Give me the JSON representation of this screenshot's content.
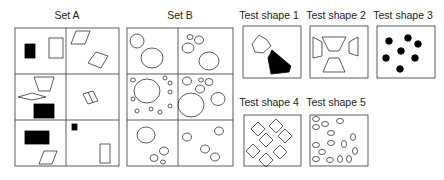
{
  "sets": [
    {
      "label": "Set A"
    },
    {
      "label": "Set B"
    }
  ],
  "tests": [
    {
      "label": "Test shape 1"
    },
    {
      "label": "Test shape 2"
    },
    {
      "label": "Test shape 3"
    },
    {
      "label": "Test shape 4"
    },
    {
      "label": "Test shape 5"
    }
  ],
  "colors": {
    "stroke": "#333333",
    "fill": "#000000",
    "background": "#ffffff"
  }
}
